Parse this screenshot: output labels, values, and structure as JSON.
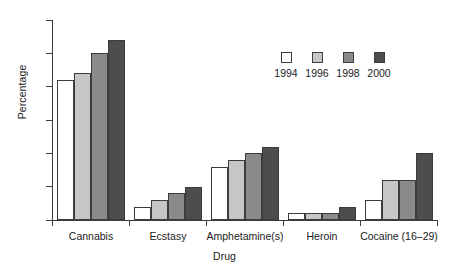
{
  "chart_data": {
    "type": "bar",
    "title": "",
    "xlabel": "Drug",
    "ylabel": "Percentage",
    "categories": [
      "Cannabis",
      "Ecstasy",
      "Amphetamine(s)",
      "Heroin",
      "Cocaine (16–29)"
    ],
    "series": [
      {
        "name": "1994",
        "color": "#ffffff",
        "values": [
          21,
          2,
          8,
          1,
          3
        ]
      },
      {
        "name": "1996",
        "color": "#c6c6c6",
        "values": [
          22,
          3,
          9,
          1,
          6
        ]
      },
      {
        "name": "1998",
        "color": "#8a8a8a",
        "values": [
          25,
          4,
          10,
          1,
          6
        ]
      },
      {
        "name": "2000",
        "color": "#4d4d4d",
        "values": [
          27,
          5,
          11,
          2,
          10
        ]
      }
    ],
    "ylim": [
      0,
      30
    ],
    "yticks": [
      0,
      5,
      10,
      15,
      20,
      25,
      30
    ],
    "ytick_labels": [
      "0",
      "5",
      "10",
      "15",
      "20",
      "25",
      "30"
    ],
    "grid": false,
    "legend_position": "upper right",
    "legend_entries": [
      "1994",
      "1996",
      "1998",
      "2000"
    ],
    "axis_color": "#3c3c3c",
    "background_color": "#ffffff"
  }
}
